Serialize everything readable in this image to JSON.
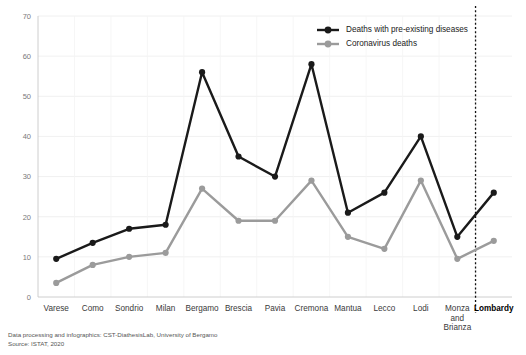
{
  "chart_data": {
    "type": "line",
    "title": "",
    "xlabel": "",
    "ylabel": "",
    "ylim": [
      0,
      70
    ],
    "yticks": [
      0,
      10,
      20,
      30,
      40,
      50,
      60,
      70
    ],
    "grid": true,
    "legend_position": "top-right",
    "categories": [
      "Varese",
      "Como",
      "Sondrio",
      "Milan",
      "Bergamo",
      "Brescia",
      "Pavia",
      "Cremona",
      "Mantua",
      "Lecco",
      "Lodi",
      "Monza and Brianza",
      "Lombardy"
    ],
    "category_labels_multiline": [
      [
        "Varese"
      ],
      [
        "Como"
      ],
      [
        "Sondrio"
      ],
      [
        "Milan"
      ],
      [
        "Bergamo"
      ],
      [
        "Brescia"
      ],
      [
        "Pavia"
      ],
      [
        "Cremona"
      ],
      [
        "Mantua"
      ],
      [
        "Lecco"
      ],
      [
        "Lodi"
      ],
      [
        "Monza",
        "and",
        "Brianza"
      ],
      [
        "Lombardy"
      ]
    ],
    "emphasized_category": "Lombardy",
    "separator_before_category": "Lombardy",
    "series": [
      {
        "name": "Deaths with pre-existing diseases",
        "color": "#1a1a1a",
        "values": [
          9.5,
          13.5,
          17,
          18,
          56,
          35,
          30,
          58,
          21,
          26,
          40,
          15,
          26
        ]
      },
      {
        "name": "Coronavirus deaths",
        "color": "#9b9b9b",
        "values": [
          3.5,
          8,
          10,
          11,
          27,
          19,
          19,
          29,
          15,
          12,
          29,
          9.5,
          14
        ]
      }
    ]
  },
  "footer": {
    "line1": "Data processing and infographics: CST-DiathesisLab, University of Bergamo",
    "line2": "Source: ISTAT, 2020"
  }
}
